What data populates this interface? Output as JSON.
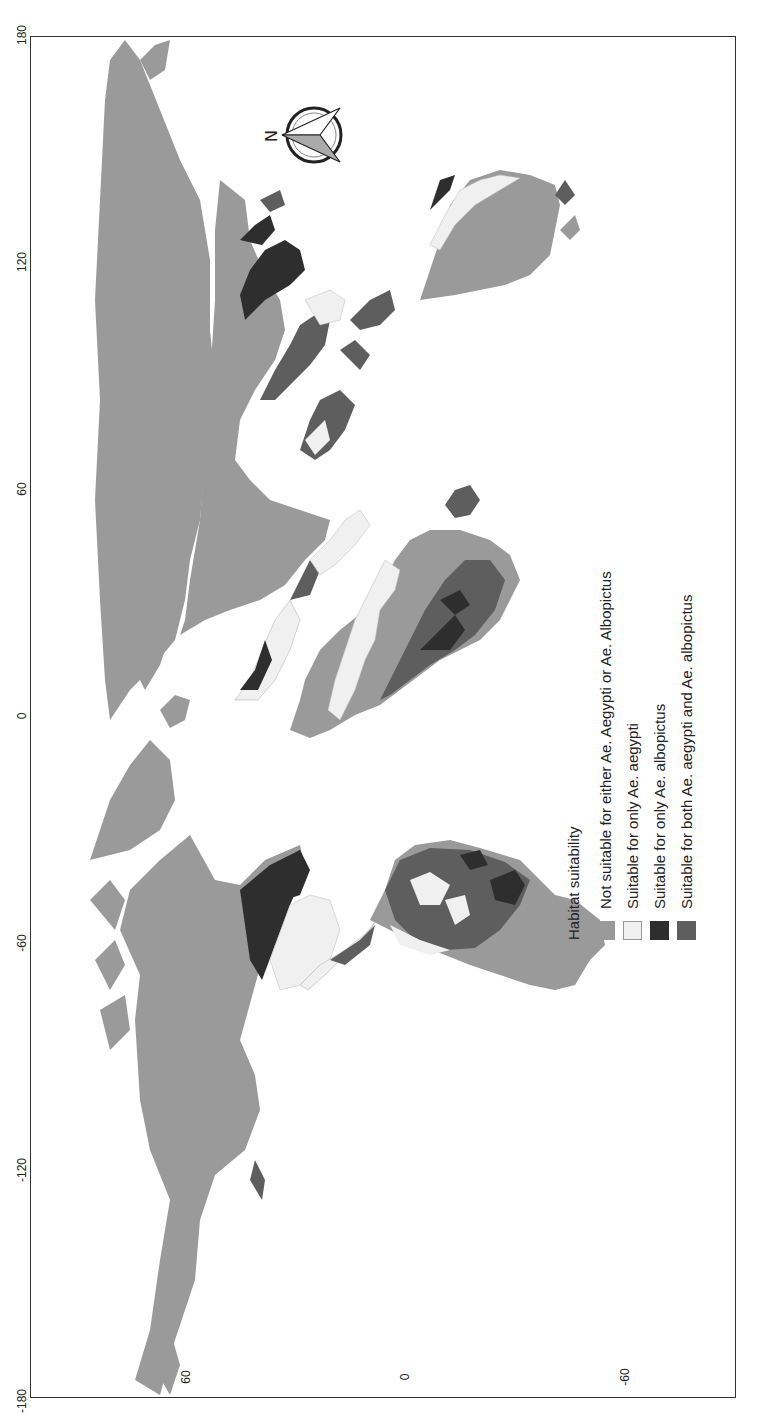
{
  "map": {
    "title": "Habitat suitability map for Aedes aegypti and Aedes albopictus",
    "orientation": "rotated 90 degrees counter-clockwise",
    "longitude_ticks": [
      {
        "label": "180",
        "y": 36
      },
      {
        "label": "120",
        "y": 263
      },
      {
        "label": "60",
        "y": 490
      },
      {
        "label": "0",
        "y": 717
      },
      {
        "label": "-60",
        "y": 944
      },
      {
        "label": "-120",
        "y": 1171
      },
      {
        "label": "-180",
        "y": 1398
      }
    ],
    "latitude_ticks": [
      {
        "label": "60",
        "x": 186
      },
      {
        "label": "0",
        "x": 405
      },
      {
        "label": "-60",
        "x": 625
      }
    ],
    "north_arrow_label": "N"
  },
  "legend": {
    "title": "Habitat suitability",
    "items": [
      {
        "label": "Not suitable for either Ae. Aegypti or Ae. Albopictus",
        "color": "#9a9a9a"
      },
      {
        "label": "Suitable for only  Ae. aegypti",
        "color": "#f0f0f0"
      },
      {
        "label": "Suitable for only  Ae. albopictus",
        "color": "#2e2e2e"
      },
      {
        "label": "Suitable for both  Ae. aegypti and Ae. albopictus",
        "color": "#5e5e5e"
      }
    ]
  },
  "colors": {
    "not_suitable": "#9a9a9a",
    "only_aegypti": "#f0f0f0",
    "only_albopictus": "#2e2e2e",
    "both": "#5e5e5e",
    "frame": "#333333"
  }
}
